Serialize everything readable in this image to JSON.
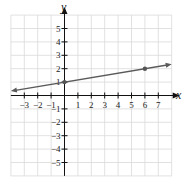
{
  "chart_data": {
    "type": "line",
    "title": "",
    "xlabel": "x",
    "ylabel": "y",
    "xlim": [
      -4,
      8
    ],
    "ylim": [
      -6,
      6
    ],
    "grid": true,
    "x_ticks": [
      -3,
      -2,
      -1,
      1,
      2,
      3,
      4,
      5,
      6,
      7
    ],
    "y_ticks": [
      -5,
      -4,
      -3,
      -2,
      -1,
      1,
      2,
      3,
      4,
      5
    ],
    "x_tick_labels": [
      "−3",
      "−2",
      "−1",
      "1",
      "2",
      "3",
      "4",
      "5",
      "6",
      "7"
    ],
    "y_tick_labels": [
      "−5",
      "−4",
      "−3",
      "−2",
      "−1",
      "1",
      "2",
      "3",
      "4",
      "5"
    ],
    "series": [
      {
        "name": "line",
        "equation": "y = (1/6)x + 1",
        "slope": 0.1667,
        "intercept": 1,
        "x": [
          -4,
          8
        ],
        "y": [
          0.333,
          2.333
        ],
        "arrows": "both",
        "color": "#555555"
      }
    ],
    "points": [
      {
        "x": 0,
        "y": 1
      },
      {
        "x": 6,
        "y": 2
      }
    ],
    "legend": null
  },
  "colors": {
    "grid": "#d9d9d9",
    "axis": "#111111",
    "line": "#5a5a5a",
    "point": "#555555"
  }
}
